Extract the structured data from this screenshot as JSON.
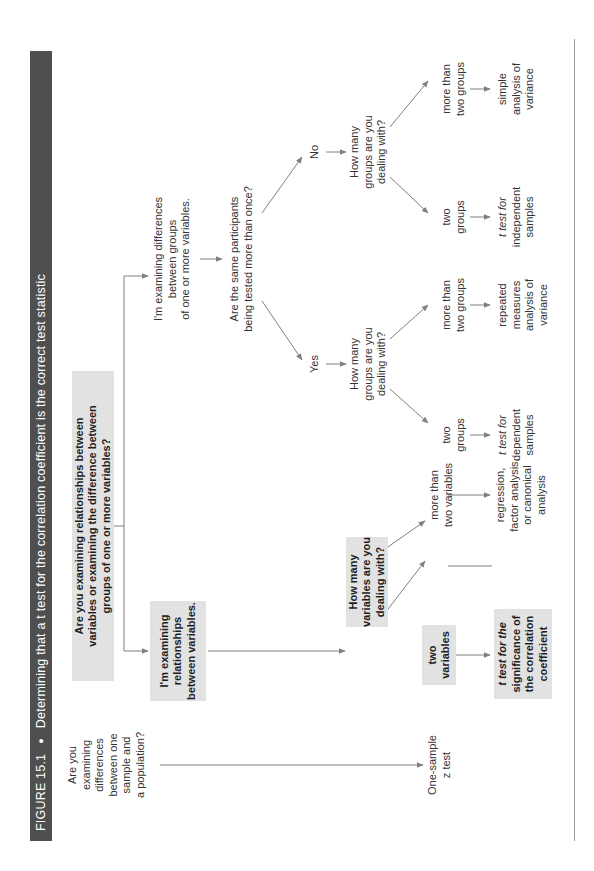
{
  "figure": {
    "label": "FIGURE 15.1",
    "separator": "●",
    "title": "Determining that a t test for the correlation coefficient is the correct test statistic"
  },
  "nodes": {
    "q_sample_population": [
      "Are you",
      "examining",
      "differences",
      "between one",
      "sample and",
      "a population?"
    ],
    "one_sample_z": [
      "One-sample",
      "z test"
    ],
    "q_main": [
      "Are you examining relationships between",
      "variables or examining the difference between",
      "groups of one or more variables?"
    ],
    "relationships": [
      "I'm examining",
      "relationships",
      "between variables."
    ],
    "differences": [
      "I'm examining differences",
      "between groups",
      "of one or more variables."
    ],
    "q_same_participants": [
      "Are the same participants",
      "being tested more than once?"
    ],
    "yes": "Yes",
    "no": "No",
    "q_how_many_variables": [
      "How many",
      "variables are you",
      "dealing with?"
    ],
    "two_variables": [
      "two",
      "variables"
    ],
    "more_than_two_variables": [
      "more than",
      "two variables"
    ],
    "t_test_correlation": [
      "t test for the",
      "significance of",
      "the correlation",
      "coefficient"
    ],
    "regression": [
      "regression,",
      "factor analysis,",
      "or canonical",
      "analysis"
    ],
    "q_groups_yes": [
      "How many",
      "groups are you",
      "dealing with?"
    ],
    "q_groups_no": [
      "How many",
      "groups are you",
      "dealing with?"
    ],
    "two_groups_dep": [
      "two",
      "groups"
    ],
    "more_groups_dep": [
      "more than",
      "two groups"
    ],
    "two_groups_ind": [
      "two",
      "groups"
    ],
    "more_groups_ind": [
      "more than",
      "two groups"
    ],
    "t_dependent": [
      "t test for",
      "dependent",
      "samples"
    ],
    "repeated_anova": [
      "repeated",
      "measures",
      "analysis of",
      "variance"
    ],
    "t_independent": [
      "t test for",
      "independent",
      "samples"
    ],
    "simple_anova": [
      "simple",
      "analysis of",
      "variance"
    ]
  },
  "colors": {
    "header_bg": "#4f4f4f",
    "header_text": "#ffffff",
    "highlight_box": "#e2e2e2",
    "line": "#808080",
    "text": "#333333"
  }
}
